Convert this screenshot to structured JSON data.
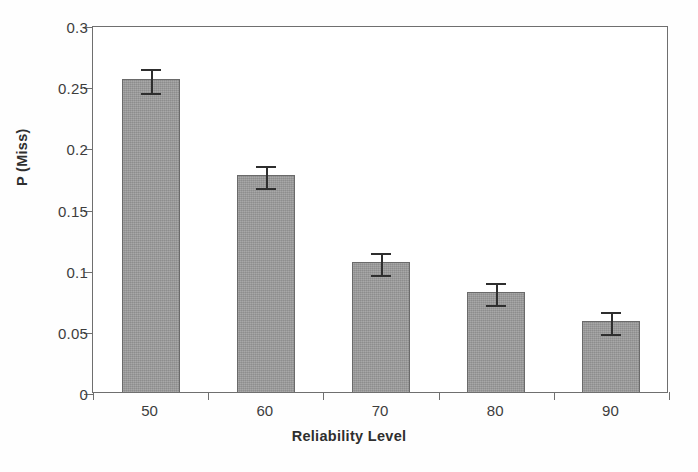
{
  "chart_data": {
    "type": "bar",
    "title": "",
    "xlabel": "Reliability Level",
    "ylabel": "P (Miss)",
    "categories": [
      "50",
      "60",
      "70",
      "80",
      "90"
    ],
    "values": [
      0.256,
      0.177,
      0.106,
      0.082,
      0.058
    ],
    "errors": [
      0.01,
      0.009,
      0.009,
      0.009,
      0.009
    ],
    "ylim": [
      0,
      0.3
    ],
    "ytick_values": [
      0,
      0.05,
      0.1,
      0.15,
      0.2,
      0.25,
      0.3
    ],
    "ytick_labels": [
      "0",
      "0.05",
      "0.1",
      "0.15",
      "0.2",
      "0.25",
      "0.3"
    ],
    "grid": false,
    "legend": false,
    "legend_position": "none",
    "series": [
      {
        "name": "P (Miss)",
        "values": [
          0.256,
          0.177,
          0.106,
          0.082,
          0.058
        ],
        "errors": [
          0.01,
          0.009,
          0.009,
          0.009,
          0.009
        ]
      }
    ],
    "colors": {
      "bar_fill": "#9b9b9b",
      "bar_border": "#6a6a6a",
      "error_bar": "#2e2e2e",
      "axis": "#6f6f6f",
      "text": "#3d3d3d",
      "background": "#ffffff"
    }
  }
}
